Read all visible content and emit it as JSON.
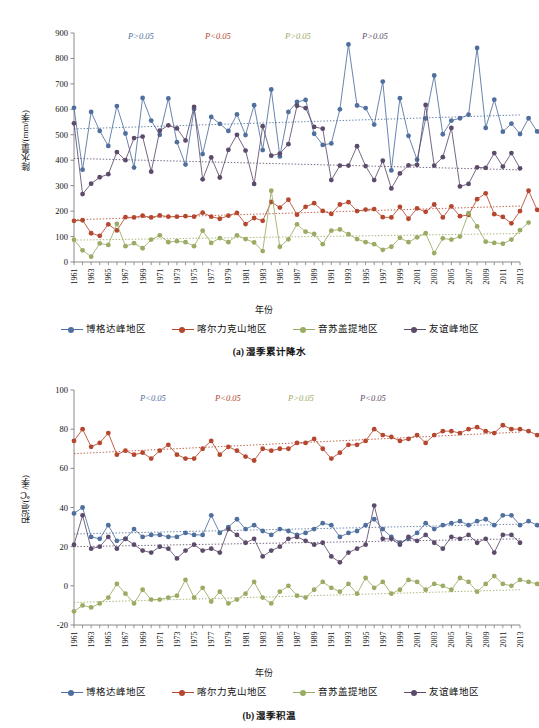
{
  "figure": {
    "series_names": [
      "博格达峰地区",
      "喀尔力克山地区",
      "音苏盖提地区",
      "友谊峰地区"
    ],
    "colors": {
      "blue": "#4f6f9e",
      "red": "#b4472e",
      "green": "#9aab63",
      "purple": "#5d4b6b",
      "axis": "#7d7d7d",
      "text": "#111111"
    },
    "legend_marker_icon": "line-with-dot-marker"
  },
  "panel_a": {
    "caption": "(a) 湿季累计降水",
    "pvalues": [
      {
        "text": "P>0.05",
        "color": "#4f6f9e"
      },
      {
        "text": "P<0.05",
        "color": "#b4472e"
      },
      {
        "text": "P>0.05",
        "color": "#9aab63"
      },
      {
        "text": "P>0.05",
        "color": "#5d4b6b"
      }
    ],
    "chart_data": {
      "type": "line",
      "title": "(a) 湿季累计降水",
      "xlabel": "年份",
      "ylabel": "降水量/(mm/季)",
      "ylim": [
        0,
        900
      ],
      "ytick_step": 100,
      "yticks": [
        0,
        100,
        200,
        300,
        400,
        500,
        600,
        700,
        800,
        900
      ],
      "xlim": [
        1961,
        2013
      ],
      "grid": false,
      "legend_position": "bottom",
      "x": [
        1961,
        1962,
        1963,
        1964,
        1965,
        1966,
        1967,
        1968,
        1969,
        1970,
        1971,
        1972,
        1973,
        1974,
        1975,
        1976,
        1977,
        1978,
        1979,
        1980,
        1981,
        1982,
        1983,
        1984,
        1985,
        1986,
        1987,
        1988,
        1989,
        1990,
        1991,
        1992,
        1993,
        1994,
        1995,
        1996,
        1997,
        1998,
        1999,
        2000,
        2001,
        2002,
        2003,
        2004,
        2005,
        2006,
        2007,
        2008,
        2009,
        2010,
        2011,
        2012,
        2013
      ],
      "xtick_labels": [
        "1961",
        "1963",
        "1965",
        "1967",
        "1969",
        "1971",
        "1973",
        "1975",
        "1977",
        "1979",
        "1981",
        "1983",
        "1985",
        "1987",
        "1989",
        "1991",
        "1993",
        "1995",
        "1997",
        "1999",
        "2001",
        "2003",
        "2005",
        "2007",
        "2009",
        "2011",
        "2013"
      ],
      "series": [
        {
          "name": "博格达峰地区",
          "color": "#4f6f9e",
          "values": [
            606,
            363,
            590,
            515,
            456,
            613,
            505,
            371,
            645,
            556,
            500,
            643,
            471,
            383,
            601,
            424,
            570,
            543,
            515,
            580,
            499,
            616,
            440,
            678,
            415,
            590,
            629,
            637,
            504,
            460,
            466,
            600,
            855,
            615,
            605,
            540,
            709,
            360,
            644,
            496,
            402,
            564,
            733,
            502,
            556,
            565,
            579,
            841,
            527,
            638,
            512,
            544,
            503,
            565,
            513
          ],
          "trend": {
            "start": 523,
            "end": 578,
            "style": "dotted"
          }
        },
        {
          "name": "喀尔力克山地区",
          "color": "#b4472e",
          "values": [
            162,
            164,
            113,
            103,
            148,
            124,
            176,
            175,
            182,
            175,
            183,
            178,
            178,
            180,
            178,
            194,
            178,
            170,
            182,
            193,
            149,
            173,
            162,
            236,
            214,
            245,
            186,
            217,
            231,
            201,
            189,
            226,
            235,
            200,
            206,
            208,
            176,
            175,
            217,
            170,
            211,
            197,
            226,
            175,
            219,
            180,
            185,
            247,
            270,
            188,
            177,
            152,
            200,
            280,
            205
          ],
          "trend": {
            "start": 166,
            "end": 220,
            "style": "dotted"
          }
        },
        {
          "name": "音苏盖提地区",
          "color": "#9aab63",
          "values": [
            87,
            46,
            21,
            73,
            67,
            150,
            62,
            74,
            54,
            88,
            105,
            78,
            82,
            78,
            62,
            123,
            75,
            94,
            78,
            105,
            90,
            77,
            43,
            280,
            60,
            89,
            148,
            119,
            110,
            70,
            123,
            128,
            109,
            90,
            78,
            70,
            48,
            60,
            95,
            78,
            97,
            113,
            35,
            93,
            88,
            100,
            192,
            140,
            80,
            75,
            72,
            88,
            125,
            155
          ],
          "trend": {
            "start": 86,
            "end": 112,
            "style": "dotted"
          }
        },
        {
          "name": "友谊峰地区",
          "color": "#5d4b6b",
          "values": [
            545,
            267,
            308,
            333,
            345,
            432,
            400,
            487,
            493,
            355,
            516,
            537,
            525,
            478,
            610,
            325,
            411,
            332,
            441,
            500,
            438,
            307,
            534,
            418,
            426,
            463,
            614,
            605,
            531,
            524,
            322,
            379,
            379,
            455,
            377,
            322,
            398,
            289,
            348,
            380,
            382,
            617,
            379,
            412,
            527,
            297,
            307,
            372,
            370,
            428,
            375,
            428,
            368
          ],
          "trend": {
            "start": 407,
            "end": 362,
            "style": "dotted"
          }
        }
      ]
    }
  },
  "panel_b": {
    "caption": "(b) 湿季积温",
    "pvalues": [
      {
        "text": "P<0.05",
        "color": "#4f6f9e"
      },
      {
        "text": "P<0.05",
        "color": "#b4472e"
      },
      {
        "text": "P>0.05",
        "color": "#9aab63"
      },
      {
        "text": "P<0.05",
        "color": "#5d4b6b"
      }
    ],
    "chart_data": {
      "type": "line",
      "title": "(b) 湿季积温",
      "xlabel": "年份",
      "ylabel": "积温/(℃/季)",
      "ylim": [
        -20,
        100
      ],
      "ytick_step": 20,
      "yticks": [
        -20,
        0,
        20,
        40,
        60,
        80,
        100
      ],
      "xlim": [
        1961,
        2013
      ],
      "grid": false,
      "legend_position": "bottom",
      "x": [
        1961,
        1962,
        1963,
        1964,
        1965,
        1966,
        1967,
        1968,
        1969,
        1970,
        1971,
        1972,
        1973,
        1974,
        1975,
        1976,
        1977,
        1978,
        1979,
        1980,
        1981,
        1982,
        1983,
        1984,
        1985,
        1986,
        1987,
        1988,
        1989,
        1990,
        1991,
        1992,
        1993,
        1994,
        1995,
        1996,
        1997,
        1998,
        1999,
        2000,
        2001,
        2002,
        2003,
        2004,
        2005,
        2006,
        2007,
        2008,
        2009,
        2010,
        2011,
        2012,
        2013
      ],
      "xtick_labels": [
        "1961",
        "1963",
        "1965",
        "1967",
        "1969",
        "1971",
        "1973",
        "1975",
        "1977",
        "1979",
        "1981",
        "1983",
        "1985",
        "1987",
        "1989",
        "1991",
        "1993",
        "1995",
        "1997",
        "1999",
        "2001",
        "2003",
        "2005",
        "2007",
        "2009",
        "2011",
        "2013"
      ],
      "series": [
        {
          "name": "博格达峰地区",
          "color": "#4f6f9e",
          "values": [
            37,
            40,
            25,
            24,
            31,
            23,
            24,
            29,
            25,
            26,
            26,
            25,
            25,
            27,
            26,
            26,
            36,
            27,
            30,
            34,
            29,
            31,
            28,
            26,
            29,
            28,
            26,
            27,
            29,
            32,
            31,
            25,
            27,
            28,
            31,
            34,
            29,
            25,
            22,
            24,
            27,
            32,
            29,
            31,
            32,
            33,
            31,
            33,
            34,
            31,
            36,
            36,
            31,
            33,
            31
          ],
          "trend": {
            "start": 26.5,
            "end": 31.5,
            "style": "dotted"
          }
        },
        {
          "name": "喀尔力克山地区",
          "color": "#b4472e",
          "values": [
            74,
            80,
            71,
            73,
            78,
            67,
            69,
            67,
            68,
            65,
            69,
            72,
            67,
            65,
            65,
            70,
            74,
            67,
            71,
            69,
            66,
            64,
            70,
            69,
            70,
            70,
            73,
            73,
            75,
            70,
            65,
            68,
            72,
            72,
            74,
            80,
            77,
            76,
            74,
            75,
            77,
            73,
            77,
            79,
            79,
            78,
            80,
            81,
            79,
            78,
            82,
            80,
            80,
            79,
            77
          ],
          "trend": {
            "start": 67.5,
            "end": 78.5,
            "style": "dotted"
          }
        },
        {
          "name": "音苏盖提地区",
          "color": "#9aab63",
          "values": [
            -13,
            -10,
            -11,
            -9,
            -6,
            1,
            -4,
            -9,
            -2,
            -7,
            -7,
            -6,
            -5,
            3,
            -6,
            -1,
            -8,
            -3,
            -9,
            -7,
            -4,
            2,
            -6,
            -9,
            -3,
            0,
            -5,
            -6,
            -2,
            2,
            -1,
            -3,
            1,
            -4,
            4,
            -1,
            2,
            -4,
            -2,
            3,
            2,
            -2,
            1,
            0,
            -2,
            4,
            2,
            -3,
            1,
            5,
            1,
            0,
            3,
            2,
            1
          ],
          "trend": {
            "start": -8.5,
            "end": -2.0,
            "style": "dotted"
          }
        },
        {
          "name": "友谊峰地区",
          "color": "#5d4b6b",
          "values": [
            21,
            36,
            19,
            20,
            25,
            19,
            24,
            21,
            18,
            17,
            20,
            19,
            14,
            18,
            21,
            18,
            19,
            17,
            29,
            26,
            22,
            24,
            15,
            18,
            20,
            24,
            25,
            23,
            21,
            22,
            15,
            12,
            17,
            19,
            21,
            41,
            24,
            24,
            21,
            25,
            23,
            26,
            22,
            19,
            25,
            24,
            26,
            22,
            24,
            17,
            26,
            26,
            22
          ],
          "trend": {
            "start": 20.0,
            "end": 24.0,
            "style": "dotted"
          }
        }
      ]
    }
  }
}
